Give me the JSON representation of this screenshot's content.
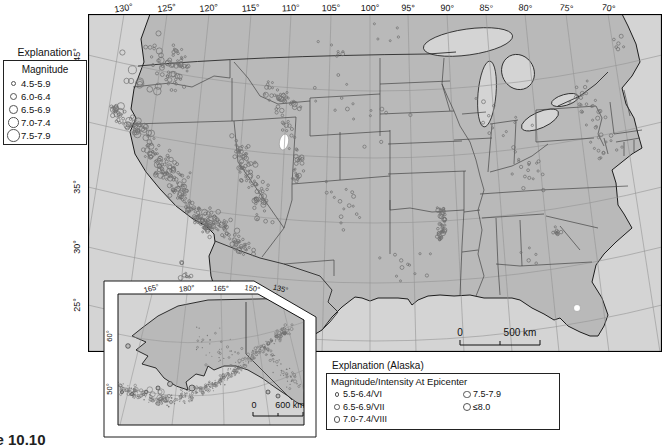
{
  "caption": "Figure 10.10",
  "colors": {
    "ocean": "#d4d4d4",
    "land": "#b9b9b9",
    "epicenter_stroke": "#6f6f6f",
    "coastline": "#1c1c1c",
    "graticule": "#949494"
  },
  "main_map": {
    "lon_labels": [
      "130°",
      "125°",
      "120°",
      "115°",
      "110°",
      "105°",
      "100°",
      "95°",
      "90°",
      "85°",
      "80°",
      "75°",
      "70°"
    ],
    "lat_labels": [
      "45°",
      "40°",
      "35°",
      "30°",
      "25°"
    ],
    "scale": {
      "start": "0",
      "end": "500 km"
    }
  },
  "alaska_inset": {
    "lon_labels": [
      "165°",
      "180°",
      "165°",
      "150°",
      "135°"
    ],
    "lat_labels": [
      "60°",
      "50°"
    ],
    "scale": {
      "start": "0",
      "end": "600 km"
    }
  },
  "legend": {
    "title": "Explanation",
    "subtitle": "Magnitude",
    "items": [
      {
        "label": "4.5-5.9"
      },
      {
        "label": "6.0-6.4"
      },
      {
        "label": "6.5-6.9"
      },
      {
        "label": "7.0-7.4"
      },
      {
        "label": "7.5-7.9"
      }
    ]
  },
  "alaska_legend": {
    "title": "Explanation (Alaska)",
    "subtitle": "Magnitude/Intensity At Epicenter",
    "col1": [
      "5.5-6.4/VI",
      "6.5-6.9/VII",
      "7.0-7.4/VIII"
    ],
    "col2": [
      "7.5-7.9",
      "≤8.0"
    ]
  },
  "epicenters": {
    "conus": [
      {
        "region": "offshore-pacific-nw",
        "p": [
          [
            55,
            30
          ],
          [
            75,
            52
          ],
          [
            92,
            72
          ]
        ],
        "s": 13,
        "n": 40,
        "r": [
          1.2,
          3.4
        ]
      },
      {
        "region": "blanco-large-events",
        "p": [
          [
            40,
            52
          ],
          [
            65,
            80
          ]
        ],
        "s": 16,
        "n": 10,
        "r": [
          2.6,
          4.4
        ]
      },
      {
        "region": "mendocino",
        "p": [
          [
            26,
            96
          ],
          [
            44,
            110
          ],
          [
            58,
            120
          ]
        ],
        "s": 9,
        "n": 50,
        "r": [
          1.2,
          3.6
        ]
      },
      {
        "region": "san-andreas-coast",
        "p": [
          [
            58,
            124
          ],
          [
            68,
            148
          ],
          [
            82,
            170
          ],
          [
            98,
            188
          ],
          [
            112,
            204
          ],
          [
            122,
            216
          ]
        ],
        "s": 7,
        "n": 120,
        "r": [
          1,
          3
        ]
      },
      {
        "region": "california-inland",
        "p": [
          [
            72,
            140
          ],
          [
            82,
            160
          ],
          [
            96,
            178
          ]
        ],
        "s": 14,
        "n": 55,
        "r": [
          1,
          2.6
        ]
      },
      {
        "region": "socal-mojave",
        "p": [
          [
            122,
            198
          ],
          [
            136,
            214
          ],
          [
            150,
            226
          ],
          [
            162,
            238
          ]
        ],
        "s": 11,
        "n": 70,
        "r": [
          1,
          3
        ]
      },
      {
        "region": "nevada-basin",
        "p": [
          [
            148,
            128
          ],
          [
            158,
            152
          ],
          [
            168,
            178
          ],
          [
            176,
            200
          ]
        ],
        "s": 12,
        "n": 85,
        "r": [
          1,
          2.8
        ]
      },
      {
        "region": "puget-sound",
        "p": [
          [
            86,
            34
          ],
          [
            94,
            48
          ],
          [
            100,
            58
          ]
        ],
        "s": 6,
        "n": 22,
        "r": [
          1,
          2.6
        ]
      },
      {
        "region": "wasatch-utah",
        "p": [
          [
            190,
            95
          ],
          [
            200,
            118
          ],
          [
            208,
            142
          ],
          [
            212,
            166
          ]
        ],
        "s": 7,
        "n": 40,
        "r": [
          1,
          2.5
        ]
      },
      {
        "region": "yellowstone-montana",
        "p": [
          [
            178,
            68
          ],
          [
            192,
            84
          ],
          [
            206,
            94
          ]
        ],
        "s": 9,
        "n": 35,
        "r": [
          1,
          2.8
        ]
      },
      {
        "region": "colorado-nm",
        "p": [
          [
            248,
            178
          ],
          [
            268,
            198
          ]
        ],
        "s": 22,
        "n": 16,
        "r": [
          1,
          2
        ]
      },
      {
        "region": "new-madrid",
        "p": [
          [
            352,
            194
          ],
          [
            356,
            208
          ],
          [
            352,
            224
          ]
        ],
        "s": 4.5,
        "n": 42,
        "r": [
          1,
          2.6
        ]
      },
      {
        "region": "charleston-sc",
        "p": [
          [
            468,
            214
          ],
          [
            474,
            222
          ]
        ],
        "s": 5,
        "n": 10,
        "r": [
          1,
          2.2
        ]
      },
      {
        "region": "northeast",
        "p": [
          [
            488,
            68
          ],
          [
            502,
            92
          ],
          [
            514,
            118
          ],
          [
            518,
            144
          ]
        ],
        "s": 16,
        "n": 38,
        "r": [
          1,
          2.2
        ]
      },
      {
        "region": "east-tennessee",
        "p": [
          [
            428,
            148
          ],
          [
            448,
            168
          ]
        ],
        "s": 20,
        "n": 18,
        "r": [
          1,
          2
        ]
      },
      {
        "region": "texas-oklahoma",
        "p": [
          [
            298,
            248
          ],
          [
            336,
            258
          ]
        ],
        "s": 26,
        "n": 12,
        "r": [
          1,
          2
        ]
      },
      {
        "region": "plains-scatter",
        "p": [
          [
            248,
            78
          ],
          [
            298,
            118
          ]
        ],
        "s": 36,
        "n": 16,
        "r": [
          1,
          2
        ]
      },
      {
        "region": "midwest-scatter",
        "p": [
          [
            398,
            98
          ],
          [
            428,
            118
          ]
        ],
        "s": 28,
        "n": 12,
        "r": [
          1,
          2
        ]
      },
      {
        "region": "montana-north",
        "p": [
          [
            228,
            28
          ],
          [
            258,
            38
          ]
        ],
        "s": 16,
        "n": 7,
        "r": [
          1,
          2
        ]
      },
      {
        "region": "canada-border",
        "p": [
          [
            288,
            12
          ],
          [
            308,
            24
          ]
        ],
        "s": 9,
        "n": 5,
        "r": [
          1,
          2
        ]
      },
      {
        "region": "st-lawrence",
        "p": [
          [
            528,
            28
          ],
          [
            542,
            38
          ]
        ],
        "s": 10,
        "n": 6,
        "r": [
          1,
          2.2
        ]
      },
      {
        "region": "baja-offshore",
        "p": [
          [
            94,
            252
          ],
          [
            104,
            274
          ],
          [
            116,
            298
          ]
        ],
        "s": 9,
        "n": 22,
        "r": [
          1,
          2.6
        ]
      },
      {
        "region": "gulf-south-scatter",
        "p": [
          [
            440,
            240
          ],
          [
            452,
            248
          ]
        ],
        "s": 10,
        "n": 5,
        "r": [
          1,
          1.8
        ]
      }
    ],
    "alaska": [
      {
        "region": "aleutian-arc",
        "p": [
          [
            0,
            92
          ],
          [
            18,
            100
          ],
          [
            40,
            106
          ],
          [
            62,
            106
          ],
          [
            84,
            98
          ],
          [
            104,
            86
          ],
          [
            122,
            72
          ],
          [
            140,
            58
          ],
          [
            158,
            44
          ],
          [
            172,
            34
          ]
        ],
        "s": 5.5,
        "n": 360,
        "r": [
          0.5,
          1.7
        ]
      },
      {
        "region": "aleutian-inner",
        "p": [
          [
            60,
            100
          ],
          [
            90,
            92
          ],
          [
            120,
            76
          ]
        ],
        "s": 3,
        "n": 60,
        "r": [
          0.5,
          1.2
        ]
      },
      {
        "region": "interior-alaska",
        "p": [
          [
            80,
            42
          ],
          [
            104,
            58
          ],
          [
            120,
            66
          ]
        ],
        "s": 16,
        "n": 40,
        "r": [
          0.5,
          1.4
        ]
      },
      {
        "region": "aleutian-large-events",
        "p": [
          [
            20,
            98
          ],
          [
            50,
            104
          ]
        ],
        "s": 8,
        "n": 10,
        "r": [
          2,
          3.4
        ]
      },
      {
        "region": "panhandle",
        "p": [
          [
            150,
            60
          ],
          [
            166,
            78
          ],
          [
            176,
            92
          ]
        ],
        "s": 8,
        "n": 40,
        "r": [
          0.6,
          1.6
        ]
      }
    ]
  }
}
